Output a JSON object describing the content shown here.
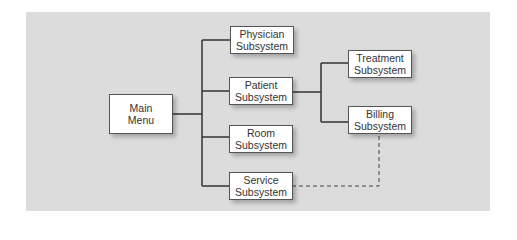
{
  "diagram": {
    "type": "hierarchy-chart",
    "background_color": "#dcdcdc",
    "nodes": [
      {
        "id": "main",
        "line1": "Main",
        "line2": "Menu"
      },
      {
        "id": "physician",
        "line1": "Physician",
        "line2": "Subsystem"
      },
      {
        "id": "patient",
        "line1": "Patient",
        "line2": "Subsystem"
      },
      {
        "id": "room",
        "line1": "Room",
        "line2": "Subsystem"
      },
      {
        "id": "service",
        "line1": "Service",
        "line2": "Subsystem"
      },
      {
        "id": "treatment",
        "line1": "Treatment",
        "line2": "Subsystem"
      },
      {
        "id": "billing",
        "line1": "Billing",
        "line2": "Subsystem"
      }
    ],
    "edges": [
      {
        "from": "main",
        "to": "physician",
        "style": "solid"
      },
      {
        "from": "main",
        "to": "patient",
        "style": "solid"
      },
      {
        "from": "main",
        "to": "room",
        "style": "solid"
      },
      {
        "from": "main",
        "to": "service",
        "style": "solid"
      },
      {
        "from": "patient",
        "to": "treatment",
        "style": "solid"
      },
      {
        "from": "patient",
        "to": "billing",
        "style": "solid"
      },
      {
        "from": "service",
        "to": "billing",
        "style": "dashed"
      }
    ]
  }
}
